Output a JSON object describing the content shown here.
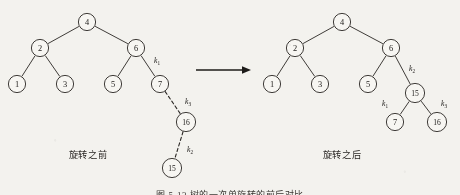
{
  "figure": {
    "caption_left": "旋转之前",
    "caption_right": "旋转之后",
    "bottom_caption": "图 5-13   树的一次单旋转的前后对比",
    "ink_color": "#2a2724",
    "background_color": "#f3f2ee"
  },
  "arrow": {
    "name": "transform-arrow",
    "direction": "right"
  },
  "trees": {
    "before": {
      "nodes": [
        {
          "id": "b4",
          "label": "4",
          "x": 87,
          "y": 22
        },
        {
          "id": "b2",
          "label": "2",
          "x": 40,
          "y": 48
        },
        {
          "id": "b6",
          "label": "6",
          "x": 136,
          "y": 48
        },
        {
          "id": "b1",
          "label": "1",
          "x": 17,
          "y": 84
        },
        {
          "id": "b3",
          "label": "3",
          "x": 65,
          "y": 84
        },
        {
          "id": "b5",
          "label": "5",
          "x": 113,
          "y": 84
        },
        {
          "id": "b7",
          "label": "7",
          "x": 160,
          "y": 84
        },
        {
          "id": "b16",
          "label": "16",
          "x": 186,
          "y": 122
        },
        {
          "id": "b15",
          "label": "15",
          "x": 172,
          "y": 168
        }
      ],
      "edges": [
        {
          "from": "b4",
          "to": "b2",
          "style": "solid",
          "label": null
        },
        {
          "from": "b4",
          "to": "b6",
          "style": "solid",
          "label": null
        },
        {
          "from": "b2",
          "to": "b1",
          "style": "solid",
          "label": null
        },
        {
          "from": "b2",
          "to": "b3",
          "style": "solid",
          "label": null
        },
        {
          "from": "b6",
          "to": "b5",
          "style": "solid",
          "label": null
        },
        {
          "from": "b6",
          "to": "b7",
          "style": "solid",
          "label": "k1",
          "lx": 157,
          "ly": 63
        },
        {
          "from": "b7",
          "to": "b16",
          "style": "dashed",
          "label": "k3",
          "lx": 188,
          "ly": 104
        },
        {
          "from": "b16",
          "to": "b15",
          "style": "dashed",
          "label": "k2",
          "lx": 190,
          "ly": 152
        }
      ]
    },
    "after": {
      "nodes": [
        {
          "id": "a4",
          "label": "4",
          "x": 342,
          "y": 22
        },
        {
          "id": "a2",
          "label": "2",
          "x": 295,
          "y": 48
        },
        {
          "id": "a6",
          "label": "6",
          "x": 391,
          "y": 48
        },
        {
          "id": "a1",
          "label": "1",
          "x": 272,
          "y": 84
        },
        {
          "id": "a3",
          "label": "3",
          "x": 320,
          "y": 84
        },
        {
          "id": "a5",
          "label": "5",
          "x": 368,
          "y": 84
        },
        {
          "id": "a15",
          "label": "15",
          "x": 415,
          "y": 93
        },
        {
          "id": "a7",
          "label": "7",
          "x": 395,
          "y": 122
        },
        {
          "id": "a16",
          "label": "16",
          "x": 437,
          "y": 122
        }
      ],
      "edges": [
        {
          "from": "a4",
          "to": "a2",
          "style": "solid",
          "label": null
        },
        {
          "from": "a4",
          "to": "a6",
          "style": "solid",
          "label": null
        },
        {
          "from": "a2",
          "to": "a1",
          "style": "solid",
          "label": null
        },
        {
          "from": "a2",
          "to": "a3",
          "style": "solid",
          "label": null
        },
        {
          "from": "a6",
          "to": "a5",
          "style": "solid",
          "label": null
        },
        {
          "from": "a6",
          "to": "a15",
          "style": "solid",
          "label": "k2",
          "lx": 412,
          "ly": 71
        },
        {
          "from": "a15",
          "to": "a7",
          "style": "solid",
          "label": "k1",
          "lx": 385,
          "ly": 106
        },
        {
          "from": "a15",
          "to": "a16",
          "style": "solid",
          "label": "k3",
          "lx": 444,
          "ly": 106
        }
      ]
    }
  },
  "klabels": {
    "k1": {
      "base": "k",
      "sub": "1"
    },
    "k2": {
      "base": "k",
      "sub": "2"
    },
    "k3": {
      "base": "k",
      "sub": "3"
    }
  }
}
